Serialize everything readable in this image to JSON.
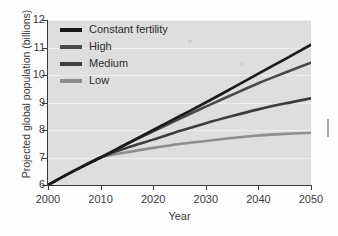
{
  "chart_data": {
    "type": "line",
    "title": "",
    "xlabel": "Year",
    "ylabel": "Projected global population (billions)",
    "xlim": [
      2000,
      2050
    ],
    "ylim": [
      6,
      12
    ],
    "grid": true,
    "legend_position": "top-left",
    "x": [
      2000,
      2005,
      2010,
      2015,
      2020,
      2025,
      2030,
      2035,
      2040,
      2045,
      2050
    ],
    "xticks": [
      "2000",
      "2010",
      "2020",
      "2030",
      "2040",
      "2050"
    ],
    "yticks": [
      "6",
      "7",
      "8",
      "9",
      "10",
      "11",
      "12"
    ],
    "series": [
      {
        "name": "Constant fertility",
        "color": "#1a1a1a",
        "values": [
          6.0,
          6.52,
          7.0,
          7.5,
          8.0,
          8.5,
          9.0,
          9.52,
          10.05,
          10.57,
          11.1
        ]
      },
      {
        "name": "High",
        "color": "#4a4a4a",
        "values": [
          6.0,
          6.52,
          7.0,
          7.49,
          7.95,
          8.41,
          8.85,
          9.28,
          9.7,
          10.08,
          10.45
        ]
      },
      {
        "name": "Medium",
        "color": "#3d3d3d",
        "values": [
          6.0,
          6.52,
          7.0,
          7.35,
          7.65,
          7.96,
          8.25,
          8.51,
          8.75,
          8.96,
          9.15
        ]
      },
      {
        "name": "Low",
        "color": "#8d8d8d",
        "values": [
          6.0,
          6.52,
          7.0,
          7.19,
          7.35,
          7.49,
          7.6,
          7.71,
          7.8,
          7.86,
          7.9
        ]
      }
    ]
  },
  "legend": {
    "items": [
      {
        "label": "Constant fertility",
        "color": "#1a1a1a"
      },
      {
        "label": "High",
        "color": "#4a4a4a"
      },
      {
        "label": "Medium",
        "color": "#3d3d3d"
      },
      {
        "label": "Low",
        "color": "#8d8d8d"
      }
    ]
  },
  "axes": {
    "y_title": "Projected global population (billions)",
    "x_title": "Year",
    "y_tick_labels": [
      "12",
      "11",
      "10",
      "9",
      "8",
      "7",
      "6"
    ],
    "x_tick_labels": [
      "2000",
      "2010",
      "2020",
      "2030",
      "2040",
      "2050"
    ]
  }
}
